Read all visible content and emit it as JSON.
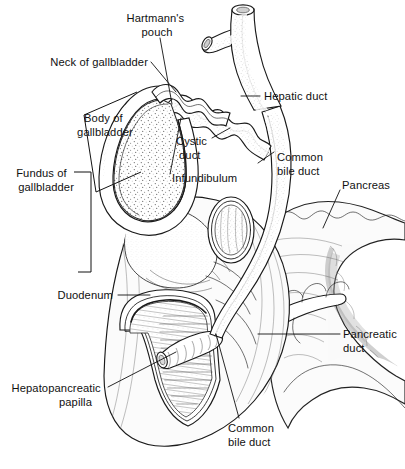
{
  "figure": {
    "width": 405,
    "height": 469,
    "background_color": "#ffffff",
    "ink_color": "#111111",
    "style": "black-and-white stippled line illustration"
  },
  "labels": [
    {
      "id": "hartmanns-pouch",
      "lines": [
        "Hartmann's",
        "pouch"
      ],
      "x": 157,
      "y": 18,
      "align": "middle"
    },
    {
      "id": "neck-of-gallbladder",
      "lines": [
        "Neck of gallbladder"
      ],
      "x": 148,
      "y": 66,
      "align": "end"
    },
    {
      "id": "hepatic-duct",
      "lines": [
        "Hepatic duct"
      ],
      "x": 264,
      "y": 99,
      "align": "start"
    },
    {
      "id": "body-of-gallbladder",
      "lines": [
        "Body of",
        "gallbladder"
      ],
      "x": 104,
      "y": 119,
      "align": "middle"
    },
    {
      "id": "cystic-duct",
      "lines": [
        "Cystic",
        "duct"
      ],
      "x": 176,
      "y": 141,
      "align": "start"
    },
    {
      "id": "common-bile-duct-upper",
      "lines": [
        "Common",
        "bile duct"
      ],
      "x": 277,
      "y": 158,
      "align": "start"
    },
    {
      "id": "infundibulum",
      "lines": [
        "Infundibulum"
      ],
      "x": 172,
      "y": 178,
      "align": "start"
    },
    {
      "id": "pancreas",
      "lines": [
        "Pancreas"
      ],
      "x": 342,
      "y": 185,
      "align": "start"
    },
    {
      "id": "fundus-of-gallbladder",
      "lines": [
        "Fundus of",
        "gallbladder"
      ],
      "x": 68,
      "y": 178,
      "align": "end"
    },
    {
      "id": "duodenum",
      "lines": [
        "Duodenum"
      ],
      "x": 113,
      "y": 298,
      "align": "end"
    },
    {
      "id": "pancreatic-duct",
      "lines": [
        "Pancreatic",
        "duct"
      ],
      "x": 343,
      "y": 338,
      "align": "start"
    },
    {
      "id": "hepatopancreatic-papilla",
      "lines": [
        "Hepatopancreatic",
        "papilla"
      ],
      "x": 103,
      "y": 392,
      "align": "end"
    },
    {
      "id": "common-bile-duct-lower",
      "lines": [
        "Common",
        "bile duct"
      ],
      "x": 228,
      "y": 428,
      "align": "start"
    }
  ],
  "structures": [
    {
      "id": "gallbladder",
      "name": "Gallbladder (opened, showing mucosa)"
    },
    {
      "id": "hepatic-duct",
      "name": "Hepatic duct with right and left branches"
    },
    {
      "id": "cystic-duct",
      "name": "Cystic duct with spiral valves of Heister"
    },
    {
      "id": "common-bile-duct",
      "name": "Common bile duct"
    },
    {
      "id": "duodenum",
      "name": "Duodenum, cut away"
    },
    {
      "id": "pancreas",
      "name": "Pancreas, head body and tail"
    },
    {
      "id": "pancreatic-duct",
      "name": "Pancreatic duct"
    },
    {
      "id": "hepatopancreatic-papilla",
      "name": "Hepatopancreatic papilla (ampulla of Vater)"
    }
  ]
}
